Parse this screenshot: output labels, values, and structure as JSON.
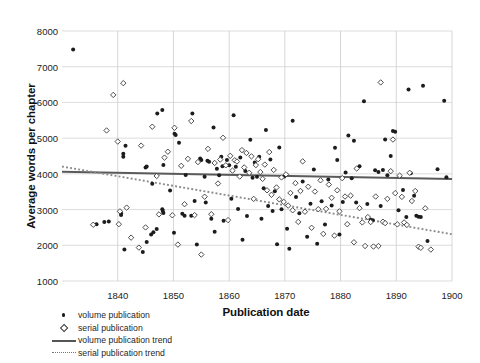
{
  "chart_data": {
    "type": "scatter",
    "title": "",
    "xlabel": "Publication date",
    "ylabel": "Average words per chapter",
    "xlim": [
      1830,
      1900
    ],
    "ylim": [
      1000,
      8000
    ],
    "xticks": [
      1840,
      1850,
      1860,
      1870,
      1880,
      1890,
      1900
    ],
    "yticks": [
      1000,
      2000,
      3000,
      4000,
      5000,
      6000,
      7000,
      8000
    ],
    "grid": true,
    "legend_position": "below-left",
    "series": [
      {
        "name": "volume publication",
        "marker": "filled-circle",
        "color": "#1c1c1c",
        "points": [
          [
            1832.0,
            7480
          ],
          [
            1836.2,
            2590
          ],
          [
            1837.6,
            2650
          ],
          [
            1838.4,
            2665
          ],
          [
            1840.6,
            2900
          ],
          [
            1840.6,
            2845
          ],
          [
            1841.0,
            4480
          ],
          [
            1841.0,
            4560
          ],
          [
            1841.4,
            4790
          ],
          [
            1841.2,
            1880
          ],
          [
            1844.5,
            1810
          ],
          [
            1845.2,
            2095
          ],
          [
            1845.0,
            4180
          ],
          [
            1845.2,
            4205
          ],
          [
            1846.0,
            2300
          ],
          [
            1846.4,
            2365
          ],
          [
            1846.2,
            3720
          ],
          [
            1847.1,
            5690
          ],
          [
            1847.0,
            2455
          ],
          [
            1848.0,
            5790
          ],
          [
            1848.2,
            4250
          ],
          [
            1848.0,
            3010
          ],
          [
            1848.1,
            2960
          ],
          [
            1848.2,
            2905
          ],
          [
            1849.4,
            3535
          ],
          [
            1850.2,
            5125
          ],
          [
            1850.4,
            5085
          ],
          [
            1850.1,
            2350
          ],
          [
            1851.0,
            4870
          ],
          [
            1851.6,
            2880
          ],
          [
            1852.2,
            3970
          ],
          [
            1852.0,
            2830
          ],
          [
            1853.4,
            5690
          ],
          [
            1853.2,
            2830
          ],
          [
            1853.8,
            3240
          ],
          [
            1854.2,
            2020
          ],
          [
            1854.8,
            4430
          ],
          [
            1855.0,
            4390
          ],
          [
            1855.6,
            3920
          ],
          [
            1855.8,
            3200
          ],
          [
            1856.1,
            4365
          ],
          [
            1856.4,
            4340
          ],
          [
            1856.8,
            2745
          ],
          [
            1857.2,
            5300
          ],
          [
            1857.4,
            2380
          ],
          [
            1857.8,
            4145
          ],
          [
            1858.2,
            3960
          ],
          [
            1858.6,
            4480
          ],
          [
            1858.8,
            4210
          ],
          [
            1859.0,
            2685
          ],
          [
            1859.6,
            4390
          ],
          [
            1860.0,
            4240
          ],
          [
            1860.4,
            3300
          ],
          [
            1860.8,
            5640
          ],
          [
            1861.2,
            4200
          ],
          [
            1861.6,
            3015
          ],
          [
            1862.0,
            4455
          ],
          [
            1862.4,
            2155
          ],
          [
            1862.9,
            4080
          ],
          [
            1863.2,
            2820
          ],
          [
            1863.8,
            4955
          ],
          [
            1864.2,
            3890
          ],
          [
            1864.6,
            4320
          ],
          [
            1865.0,
            3920
          ],
          [
            1865.4,
            4480
          ],
          [
            1865.8,
            2740
          ],
          [
            1866.2,
            3600
          ],
          [
            1866.6,
            5230
          ],
          [
            1867.0,
            3100
          ],
          [
            1867.4,
            4405
          ],
          [
            1867.8,
            2960
          ],
          [
            1868.2,
            3515
          ],
          [
            1868.6,
            2030
          ],
          [
            1869.0,
            4740
          ],
          [
            1869.4,
            3010
          ],
          [
            1869.9,
            3925
          ],
          [
            1870.4,
            2460
          ],
          [
            1870.8,
            1900
          ],
          [
            1871.4,
            5490
          ],
          [
            1872.0,
            3355
          ],
          [
            1872.6,
            2900
          ],
          [
            1873.2,
            3785
          ],
          [
            1874.0,
            2240
          ],
          [
            1874.6,
            3160
          ],
          [
            1875.2,
            4125
          ],
          [
            1875.8,
            2040
          ],
          [
            1876.6,
            3230
          ],
          [
            1877.2,
            2580
          ],
          [
            1877.8,
            3840
          ],
          [
            1878.4,
            3115
          ],
          [
            1879.0,
            4730
          ],
          [
            1879.4,
            4390
          ],
          [
            1879.8,
            2300
          ],
          [
            1880.4,
            3210
          ],
          [
            1880.9,
            4040
          ],
          [
            1881.4,
            5075
          ],
          [
            1882.0,
            3880
          ],
          [
            1882.4,
            4930
          ],
          [
            1882.8,
            3200
          ],
          [
            1883.4,
            4215
          ],
          [
            1884.2,
            6030
          ],
          [
            1884.8,
            3155
          ],
          [
            1885.4,
            2715
          ],
          [
            1885.8,
            2700
          ],
          [
            1886.2,
            4100
          ],
          [
            1886.8,
            4050
          ],
          [
            1887.2,
            3100
          ],
          [
            1887.6,
            4105
          ],
          [
            1888.0,
            4960
          ],
          [
            1888.4,
            3960
          ],
          [
            1889.0,
            4500
          ],
          [
            1889.4,
            5200
          ],
          [
            1889.8,
            5180
          ],
          [
            1890.4,
            2980
          ],
          [
            1891.2,
            3550
          ],
          [
            1891.8,
            2790
          ],
          [
            1892.2,
            6360
          ],
          [
            1892.6,
            4020
          ],
          [
            1893.2,
            3385
          ],
          [
            1893.6,
            2830
          ],
          [
            1894.0,
            2800
          ],
          [
            1894.4,
            2790
          ],
          [
            1894.8,
            6470
          ],
          [
            1895.6,
            2120
          ],
          [
            1897.4,
            4130
          ],
          [
            1898.6,
            6050
          ],
          [
            1899.0,
            3905
          ]
        ]
      },
      {
        "name": "serial publication",
        "marker": "open-diamond",
        "color": "#3a3a3a",
        "points": [
          [
            1835.6,
            2575
          ],
          [
            1838.0,
            5215
          ],
          [
            1839.2,
            6210
          ],
          [
            1840.4,
            2950
          ],
          [
            1840.2,
            2590
          ],
          [
            1840.0,
            4905
          ],
          [
            1841.0,
            6540
          ],
          [
            1841.6,
            3055
          ],
          [
            1842.4,
            2215
          ],
          [
            1843.8,
            1935
          ],
          [
            1844.2,
            4790
          ],
          [
            1845.0,
            2500
          ],
          [
            1846.2,
            5320
          ],
          [
            1847.0,
            3940
          ],
          [
            1847.4,
            2865
          ],
          [
            1848.4,
            4455
          ],
          [
            1849.0,
            4620
          ],
          [
            1849.8,
            2840
          ],
          [
            1850.2,
            5290
          ],
          [
            1850.8,
            2020
          ],
          [
            1851.4,
            4225
          ],
          [
            1852.0,
            3150
          ],
          [
            1852.6,
            4420
          ],
          [
            1853.2,
            5480
          ],
          [
            1853.8,
            2845
          ],
          [
            1854.4,
            4330
          ],
          [
            1855.0,
            1740
          ],
          [
            1855.6,
            3360
          ],
          [
            1856.2,
            4700
          ],
          [
            1856.8,
            2870
          ],
          [
            1857.4,
            4305
          ],
          [
            1858.0,
            3730
          ],
          [
            1858.4,
            4400
          ],
          [
            1858.9,
            5010
          ],
          [
            1859.4,
            4240
          ],
          [
            1859.8,
            2705
          ],
          [
            1860.2,
            4505
          ],
          [
            1860.6,
            4090
          ],
          [
            1861.0,
            4380
          ],
          [
            1861.4,
            4345
          ],
          [
            1861.9,
            3925
          ],
          [
            1862.3,
            4665
          ],
          [
            1862.7,
            4180
          ],
          [
            1863.1,
            4585
          ],
          [
            1863.6,
            4030
          ],
          [
            1864.0,
            4490
          ],
          [
            1864.4,
            3300
          ],
          [
            1864.8,
            4245
          ],
          [
            1865.2,
            4410
          ],
          [
            1865.6,
            4050
          ],
          [
            1866.0,
            3860
          ],
          [
            1866.4,
            4260
          ],
          [
            1866.8,
            3540
          ],
          [
            1867.2,
            4610
          ],
          [
            1867.6,
            3415
          ],
          [
            1868.0,
            4110
          ],
          [
            1868.5,
            3620
          ],
          [
            1869.0,
            3285
          ],
          [
            1869.4,
            3900
          ],
          [
            1869.8,
            3215
          ],
          [
            1870.2,
            3985
          ],
          [
            1870.6,
            3110
          ],
          [
            1871.0,
            3465
          ],
          [
            1871.4,
            2980
          ],
          [
            1871.9,
            3740
          ],
          [
            1872.4,
            2655
          ],
          [
            1872.8,
            3520
          ],
          [
            1873.2,
            4350
          ],
          [
            1873.6,
            2940
          ],
          [
            1874.2,
            3640
          ],
          [
            1874.8,
            2490
          ],
          [
            1875.4,
            3505
          ],
          [
            1876.0,
            3010
          ],
          [
            1876.4,
            3820
          ],
          [
            1876.9,
            2320
          ],
          [
            1877.4,
            3020
          ],
          [
            1877.9,
            3700
          ],
          [
            1878.4,
            3330
          ],
          [
            1878.9,
            2270
          ],
          [
            1879.4,
            3540
          ],
          [
            1879.8,
            2950
          ],
          [
            1880.3,
            3880
          ],
          [
            1880.8,
            3365
          ],
          [
            1881.2,
            2590
          ],
          [
            1881.8,
            3390
          ],
          [
            1882.4,
            2085
          ],
          [
            1882.9,
            4150
          ],
          [
            1883.4,
            3040
          ],
          [
            1883.9,
            2640
          ],
          [
            1884.4,
            1980
          ],
          [
            1884.9,
            2790
          ],
          [
            1885.4,
            2650
          ],
          [
            1885.9,
            1965
          ],
          [
            1886.3,
            3365
          ],
          [
            1886.8,
            1980
          ],
          [
            1887.2,
            6560
          ],
          [
            1887.6,
            2660
          ],
          [
            1888.0,
            2620
          ],
          [
            1888.4,
            3300
          ],
          [
            1889.0,
            4075
          ],
          [
            1889.4,
            4960
          ],
          [
            1889.8,
            3460
          ],
          [
            1890.2,
            2585
          ],
          [
            1890.6,
            3950
          ],
          [
            1891.0,
            3355
          ],
          [
            1891.4,
            2640
          ],
          [
            1891.9,
            2570
          ],
          [
            1892.4,
            4030
          ],
          [
            1892.8,
            3240
          ],
          [
            1893.4,
            3520
          ],
          [
            1894.0,
            1960
          ],
          [
            1894.4,
            1930
          ],
          [
            1895.2,
            3035
          ],
          [
            1896.2,
            1880
          ]
        ]
      }
    ],
    "trends": [
      {
        "name": "volume publication trend",
        "style": "solid",
        "color": "#5a5a5a",
        "x": [
          1830,
          1900
        ],
        "y": [
          4060,
          3855
        ]
      },
      {
        "name": "serial publication trend",
        "style": "dotted",
        "color": "#8a8a8a",
        "x": [
          1830,
          1900
        ],
        "y": [
          4205,
          2310
        ]
      }
    ],
    "legend": [
      {
        "label": "volume publication",
        "key": "filled-circle"
      },
      {
        "label": "serial publication",
        "key": "open-diamond"
      },
      {
        "label": "volume publication trend",
        "key": "solid-line"
      },
      {
        "label": "serial publication trend",
        "key": "dotted-line"
      }
    ]
  }
}
